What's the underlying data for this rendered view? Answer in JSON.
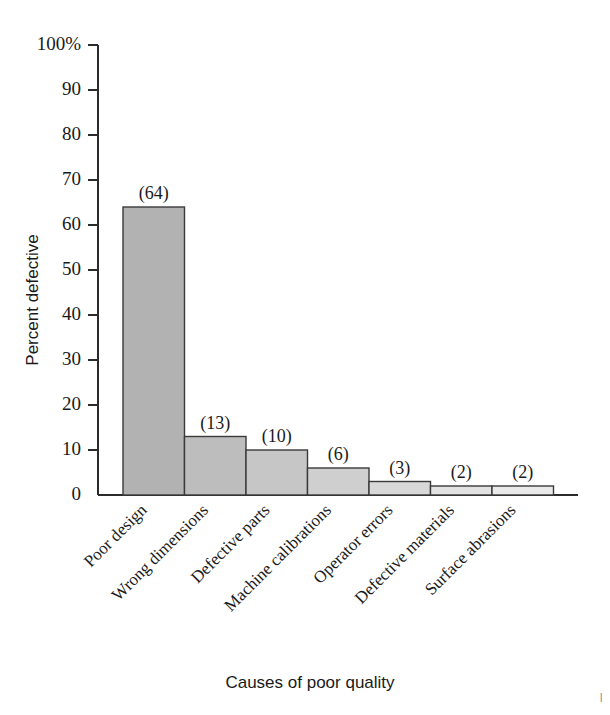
{
  "chart_data": {
    "type": "bar",
    "title": "",
    "subtitle": "",
    "xlabel": "Causes of poor quality",
    "ylabel": "Percent defective",
    "categories": [
      "Poor design",
      "Wrong dimensions",
      "Defective parts",
      "Machine calibrations",
      "Operator errors",
      "Defective materials",
      "Surface abrasions"
    ],
    "values": [
      64,
      13,
      10,
      6,
      3,
      2,
      2
    ],
    "data_labels": [
      "(64)",
      "(13)",
      "(10)",
      "(6)",
      "(3)",
      "(2)",
      "(2)"
    ],
    "ylim": [
      0,
      100
    ],
    "ytick_values": [
      0,
      10,
      20,
      30,
      40,
      50,
      60,
      70,
      80,
      90,
      100
    ],
    "ytick_labels": [
      "0",
      "10",
      "20",
      "30",
      "40",
      "50",
      "60",
      "70",
      "80",
      "90",
      "100%"
    ],
    "grid": false,
    "legend": null,
    "legend_position": "none",
    "bar_gap": 0,
    "bar_colors": [
      "#b2b2b2",
      "#bdbdbd",
      "#c6c6c6",
      "#cfcfcf",
      "#d8d8d8",
      "#e2e2e2",
      "#eaeaea"
    ],
    "bar_edge_color": "#3a3a3a",
    "axis_color": "#2b2b2b",
    "text_color": "#1a1a1a",
    "background_color": "#ffffff",
    "category_label_rotation_deg": -45,
    "units": "percent"
  },
  "figure": {
    "corner_mark": "|"
  }
}
